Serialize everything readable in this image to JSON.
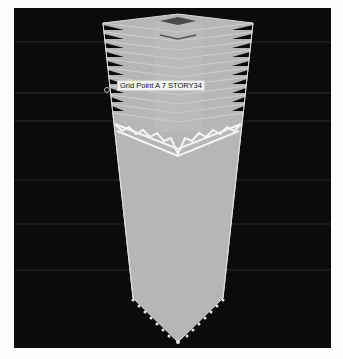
{
  "viewport": {
    "background_color": "#0b0b0b",
    "grid_line_color": "#2a2a2a",
    "grid_lines_y": [
      34,
      85,
      113,
      172,
      216,
      262
    ]
  },
  "model": {
    "type": "3d-building-frame",
    "stories_visible_top_section": 11,
    "building_fill_color": "#b9b9b9",
    "edge_color": "#d8d8d8",
    "roof_color": "#4a4a4a",
    "bracing_color": "#f4f4f4"
  },
  "tooltip": {
    "text": "Grid Point A 7 STORY34"
  },
  "icons": {
    "point_marker": "circle-marker-icon"
  }
}
